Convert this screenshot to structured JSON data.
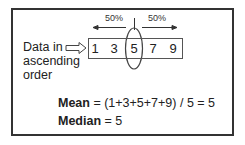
{
  "diagram": {
    "label_lines": [
      "Data in",
      "ascending",
      "order"
    ],
    "left_percent": "50%",
    "right_percent": "50%",
    "values": [
      "1",
      "3",
      "5",
      "7",
      "9"
    ],
    "highlighted_value": "5",
    "mean": {
      "term": "Mean",
      "expression": " = (1+3+5+7+9) / 5 = 5"
    },
    "median": {
      "term": "Median",
      "expression": " = 5"
    }
  }
}
